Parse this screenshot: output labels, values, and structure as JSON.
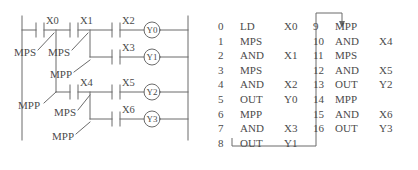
{
  "diagram": {
    "type": "plc-ladder-logic-with-instruction-list",
    "ladder": {
      "contacts": [
        {
          "id": "X0",
          "label": "X0"
        },
        {
          "id": "X1",
          "label": "X1"
        },
        {
          "id": "X2",
          "label": "X2"
        },
        {
          "id": "X3",
          "label": "X3"
        },
        {
          "id": "X4",
          "label": "X4"
        },
        {
          "id": "X5",
          "label": "X5"
        },
        {
          "id": "X6",
          "label": "X6"
        }
      ],
      "coils": [
        {
          "id": "Y0",
          "label": "Y0"
        },
        {
          "id": "Y1",
          "label": "Y1"
        },
        {
          "id": "Y2",
          "label": "Y2"
        },
        {
          "id": "Y3",
          "label": "Y3"
        }
      ],
      "stack_annotations": [
        {
          "id": "mps-x0",
          "label": "MPS"
        },
        {
          "id": "mps-x1",
          "label": "MPS"
        },
        {
          "id": "mpp-x1",
          "label": "MPP"
        },
        {
          "id": "mpp-x0",
          "label": "MPP"
        },
        {
          "id": "mps-x4",
          "label": "MPS"
        },
        {
          "id": "mpp-x4",
          "label": "MPP"
        }
      ]
    },
    "instruction_list": {
      "column_left": [
        {
          "step": "0",
          "op": "LD",
          "arg": "X0"
        },
        {
          "step": "1",
          "op": "MPS",
          "arg": ""
        },
        {
          "step": "2",
          "op": "AND",
          "arg": "X1"
        },
        {
          "step": "3",
          "op": "MPS",
          "arg": ""
        },
        {
          "step": "4",
          "op": "AND",
          "arg": "X2"
        },
        {
          "step": "5",
          "op": "OUT",
          "arg": "Y0"
        },
        {
          "step": "6",
          "op": "MPP",
          "arg": ""
        },
        {
          "step": "7",
          "op": "AND",
          "arg": "X3"
        },
        {
          "step": "8",
          "op": "OUT",
          "arg": "Y1"
        }
      ],
      "column_right": [
        {
          "step": "9",
          "op": "MPP",
          "arg": ""
        },
        {
          "step": "10",
          "op": "AND",
          "arg": "X4"
        },
        {
          "step": "11",
          "op": "MPS",
          "arg": ""
        },
        {
          "step": "12",
          "op": "AND",
          "arg": "X5"
        },
        {
          "step": "13",
          "op": "OUT",
          "arg": "Y2"
        },
        {
          "step": "14",
          "op": "MPP",
          "arg": ""
        },
        {
          "step": "15",
          "op": "AND",
          "arg": "X6"
        },
        {
          "step": "16",
          "op": "OUT",
          "arg": "Y3"
        }
      ]
    },
    "colors": {
      "line": "#6b6b6b",
      "text": "#4b4b4b",
      "background": "#ffffff"
    }
  }
}
